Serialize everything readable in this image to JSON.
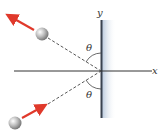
{
  "diagram": {
    "axes": {
      "x_label": "x",
      "y_label": "y"
    },
    "angles": {
      "incident_label": "θ",
      "reflected_label": "θ"
    },
    "colors": {
      "arrow": "#e0392b",
      "wall": "#3a4350",
      "wall_shade": "#c9d6e6",
      "ball": "#a8a8a8",
      "axis": "#333333"
    },
    "elements": [
      "wall along y-axis",
      "incoming ball (lower left) with velocity arrow toward wall",
      "outgoing ball (upper left) with velocity arrow away from wall",
      "dashed trajectory lines meeting at origin"
    ]
  }
}
